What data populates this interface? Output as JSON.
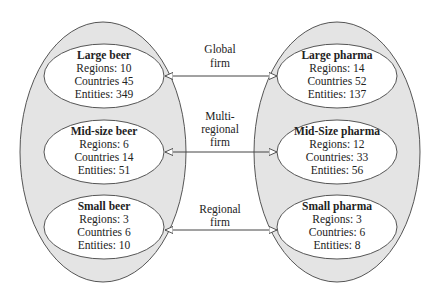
{
  "colors": {
    "outer_fill": "#e4e4e4",
    "stroke": "#555555",
    "inner_fill": "#ffffff",
    "text": "#222222"
  },
  "left_group": {
    "name": "beer",
    "nodes": [
      {
        "title": "Large beer",
        "lines": [
          "Regions: 10",
          "Countries 45",
          "Entities: 349"
        ]
      },
      {
        "title": "Mid-size beer",
        "lines": [
          "Regions: 6",
          "Countries 14",
          "Entities: 51"
        ]
      },
      {
        "title": "Small beer",
        "lines": [
          "Regions: 3",
          "Countries 6",
          "Entities: 10"
        ]
      }
    ]
  },
  "right_group": {
    "name": "pharma",
    "nodes": [
      {
        "title": "Large pharma",
        "lines": [
          "Regions: 14",
          "Countries 52",
          "Entities: 137"
        ]
      },
      {
        "title": "Mid-Size pharma",
        "lines": [
          "Regions: 12",
          "Countries: 33",
          "Entities: 56"
        ]
      },
      {
        "title": "Small pharma",
        "lines": [
          "Regions: 3",
          "Countries: 6",
          "Entities: 8"
        ]
      }
    ]
  },
  "links": [
    {
      "label_lines": [
        "Global",
        "firm"
      ]
    },
    {
      "label_lines": [
        "Multi-",
        "regional",
        "firm"
      ]
    },
    {
      "label_lines": [
        "Regional",
        "firm"
      ]
    }
  ]
}
